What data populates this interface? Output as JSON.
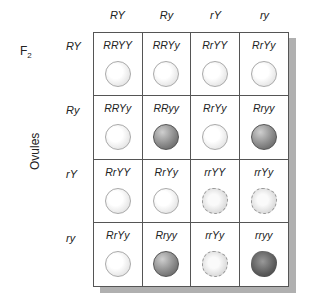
{
  "generation_label": {
    "base": "F",
    "sub": "2"
  },
  "axis_label_rows": "Ovules",
  "column_headers": [
    "RY",
    "Ry",
    "rY",
    "ry"
  ],
  "row_headers": [
    "RY",
    "Ry",
    "rY",
    "ry"
  ],
  "cells": [
    [
      {
        "genotype": "RRYY",
        "phenotype": "round-yellow"
      },
      {
        "genotype": "RRYy",
        "phenotype": "round-yellow"
      },
      {
        "genotype": "RrYY",
        "phenotype": "round-yellow"
      },
      {
        "genotype": "RrYy",
        "phenotype": "round-yellow"
      }
    ],
    [
      {
        "genotype": "RRYy",
        "phenotype": "round-yellow"
      },
      {
        "genotype": "RRyy",
        "phenotype": "round-green"
      },
      {
        "genotype": "RrYy",
        "phenotype": "round-yellow"
      },
      {
        "genotype": "Rryy",
        "phenotype": "round-green"
      }
    ],
    [
      {
        "genotype": "RrYY",
        "phenotype": "round-yellow"
      },
      {
        "genotype": "RrYy",
        "phenotype": "round-yellow"
      },
      {
        "genotype": "rrYY",
        "phenotype": "wrinkled-yellow"
      },
      {
        "genotype": "rrYy",
        "phenotype": "wrinkled-yellow"
      }
    ],
    [
      {
        "genotype": "RrYy",
        "phenotype": "round-yellow"
      },
      {
        "genotype": "Rryy",
        "phenotype": "round-green"
      },
      {
        "genotype": "rrYy",
        "phenotype": "wrinkled-yellow"
      },
      {
        "genotype": "rryy",
        "phenotype": "wrinkled-green"
      }
    ]
  ]
}
